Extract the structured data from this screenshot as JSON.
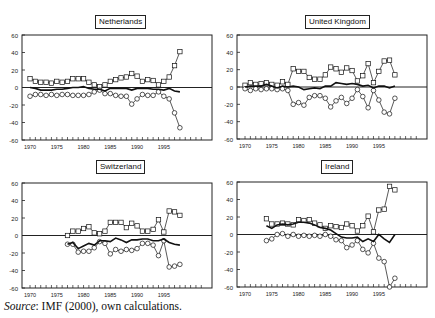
{
  "source": {
    "label": "Source",
    "text": ": IMF (2000), own calculations."
  },
  "chart_data": [
    {
      "type": "line",
      "title": "Netherlands",
      "xlabel": "",
      "ylabel": "",
      "xlim": [
        1968.5,
        2004
      ],
      "ylim": [
        -60,
        60
      ],
      "xticks": [
        "1970",
        "1975",
        "1980",
        "1985",
        "1990",
        "1995"
      ],
      "yticks": [
        "60",
        "40",
        "20",
        "0",
        "-20",
        "-40",
        "-60"
      ],
      "series": [
        {
          "name": "squares",
          "marker": "square",
          "x": [
            1970,
            1971,
            1972,
            1973,
            1974,
            1975,
            1976,
            1977,
            1978,
            1979,
            1980,
            1981,
            1982,
            1983,
            1984,
            1985,
            1986,
            1987,
            1988,
            1989,
            1990,
            1991,
            1992,
            1993,
            1994,
            1995,
            1996,
            1997,
            1998
          ],
          "values": [
            10,
            7,
            6,
            6,
            5,
            7,
            6,
            7,
            10,
            10,
            10,
            6,
            3,
            1,
            3,
            7,
            9,
            11,
            12,
            16,
            13,
            7,
            9,
            8,
            3,
            7,
            12,
            25,
            41
          ]
        },
        {
          "name": "circles",
          "marker": "circle",
          "x": [
            1970,
            1971,
            1972,
            1973,
            1974,
            1975,
            1976,
            1977,
            1978,
            1979,
            1980,
            1981,
            1982,
            1983,
            1984,
            1985,
            1986,
            1987,
            1988,
            1989,
            1990,
            1991,
            1992,
            1993,
            1994,
            1995,
            1996,
            1997,
            1998
          ],
          "values": [
            -10,
            -8,
            -8,
            -9,
            -8,
            -9,
            -8,
            -8,
            -9,
            -9,
            -9,
            -8,
            -5,
            -3,
            -7,
            -7,
            -9,
            -10,
            -10,
            -19,
            -13,
            -8,
            -9,
            -9,
            -5,
            -10,
            -13,
            -29,
            -46
          ]
        },
        {
          "name": "line",
          "marker": "none",
          "x": [
            1970,
            1971,
            1972,
            1973,
            1974,
            1975,
            1976,
            1977,
            1978,
            1979,
            1980,
            1981,
            1982,
            1983,
            1984,
            1985,
            1986,
            1987,
            1988,
            1989,
            1990,
            1991,
            1992,
            1993,
            1994,
            1995,
            1996,
            1997,
            1998
          ],
          "values": [
            0,
            -1,
            -3,
            -3,
            -3,
            -2,
            -2,
            -1,
            0,
            0,
            1,
            -1,
            -2,
            -2,
            -4,
            -1,
            -1,
            -1,
            -1,
            -3,
            -1,
            -1,
            -1,
            -2,
            -2,
            -3,
            -1,
            -4,
            -5
          ]
        }
      ]
    },
    {
      "type": "line",
      "title": "United Kingdom",
      "xlabel": "",
      "ylabel": "",
      "xlim": [
        1968.5,
        2004
      ],
      "ylim": [
        -60,
        60
      ],
      "xticks": [
        "1970",
        "1975",
        "1980",
        "1985",
        "1990",
        "1995"
      ],
      "yticks": [
        "60",
        "40",
        "20",
        "0",
        "-20",
        "-40",
        "-60"
      ],
      "series": [
        {
          "name": "squares",
          "marker": "square",
          "x": [
            1970,
            1971,
            1972,
            1973,
            1974,
            1975,
            1976,
            1977,
            1978,
            1979,
            1980,
            1981,
            1982,
            1983,
            1984,
            1985,
            1986,
            1987,
            1988,
            1989,
            1990,
            1991,
            1992,
            1993,
            1994,
            1995,
            1996,
            1997,
            1998
          ],
          "values": [
            2,
            5,
            3,
            4,
            5,
            3,
            2,
            6,
            3,
            21,
            18,
            18,
            11,
            9,
            9,
            14,
            23,
            21,
            17,
            22,
            19,
            7,
            13,
            27,
            5,
            18,
            30,
            31,
            14
          ]
        },
        {
          "name": "circles",
          "marker": "circle",
          "x": [
            1970,
            1971,
            1972,
            1973,
            1974,
            1975,
            1976,
            1977,
            1978,
            1979,
            1980,
            1981,
            1982,
            1983,
            1984,
            1985,
            1986,
            1987,
            1988,
            1989,
            1990,
            1991,
            1992,
            1993,
            1994,
            1995,
            1996,
            1997,
            1998
          ],
          "values": [
            -2,
            -4,
            -2,
            -3,
            -2,
            -2,
            -3,
            -2,
            -4,
            -20,
            -18,
            -21,
            -12,
            -10,
            -10,
            -13,
            -23,
            -16,
            -12,
            -19,
            -13,
            -3,
            -11,
            -24,
            -4,
            -15,
            -29,
            -31,
            -13
          ]
        },
        {
          "name": "line",
          "marker": "none",
          "x": [
            1970,
            1971,
            1972,
            1973,
            1974,
            1975,
            1976,
            1977,
            1978,
            1979,
            1980,
            1981,
            1982,
            1983,
            1984,
            1985,
            1986,
            1987,
            1988,
            1989,
            1990,
            1991,
            1992,
            1993,
            1994,
            1995,
            1996,
            1997,
            1998
          ],
          "values": [
            0,
            1,
            1,
            1,
            3,
            1,
            -1,
            1,
            0,
            1,
            0,
            -3,
            -2,
            -1,
            -2,
            1,
            1,
            5,
            4,
            3,
            4,
            3,
            1,
            2,
            -1,
            1,
            1,
            -1,
            1
          ]
        }
      ]
    },
    {
      "type": "line",
      "title": "Switzerland",
      "xlabel": "",
      "ylabel": "",
      "xlim": [
        1968.5,
        2004
      ],
      "ylim": [
        -60,
        60
      ],
      "xticks": [
        "1970",
        "1975",
        "1980",
        "1985",
        "1990",
        "1995"
      ],
      "yticks": [
        "60",
        "40",
        "20",
        "0",
        "-20",
        "-40",
        "-60"
      ],
      "series": [
        {
          "name": "squares",
          "marker": "square",
          "x": [
            1977,
            1978,
            1979,
            1980,
            1981,
            1982,
            1983,
            1984,
            1985,
            1986,
            1987,
            1988,
            1989,
            1990,
            1991,
            1992,
            1993,
            1994,
            1995,
            1996,
            1997,
            1998
          ],
          "values": [
            0,
            5,
            5,
            8,
            10,
            3,
            2,
            5,
            15,
            15,
            15,
            9,
            14,
            11,
            5,
            5,
            7,
            18,
            4,
            28,
            27,
            23
          ]
        },
        {
          "name": "circles",
          "marker": "circle",
          "x": [
            1977,
            1978,
            1979,
            1980,
            1981,
            1982,
            1983,
            1984,
            1985,
            1986,
            1987,
            1988,
            1989,
            1990,
            1991,
            1992,
            1993,
            1994,
            1995,
            1996,
            1997,
            1998
          ],
          "values": [
            -10,
            -10,
            -19,
            -18,
            -18,
            -14,
            -7,
            -9,
            -21,
            -16,
            -18,
            -16,
            -17,
            -15,
            -9,
            -9,
            -11,
            -23,
            -6,
            -36,
            -35,
            -33
          ]
        },
        {
          "name": "line",
          "marker": "none",
          "x": [
            1977,
            1978,
            1979,
            1980,
            1981,
            1982,
            1983,
            1984,
            1985,
            1986,
            1987,
            1988,
            1989,
            1990,
            1991,
            1992,
            1993,
            1994,
            1995,
            1996,
            1997,
            1998
          ],
          "values": [
            -10,
            -8,
            -15,
            -12,
            -9,
            -11,
            -6,
            -6,
            -7,
            -3,
            -5,
            -8,
            -5,
            -5,
            -4,
            -4,
            -6,
            -6,
            -4,
            -8,
            -10,
            -11
          ]
        }
      ]
    },
    {
      "type": "line",
      "title": "Ireland",
      "xlabel": "",
      "ylabel": "",
      "xlim": [
        1968.5,
        2004
      ],
      "ylim": [
        -60,
        60
      ],
      "xticks": [
        "1970",
        "1975",
        "1980",
        "1985",
        "1990",
        "1995"
      ],
      "yticks": [
        "60",
        "40",
        "20",
        "0",
        "-20",
        "-40",
        "-60"
      ],
      "series": [
        {
          "name": "squares",
          "marker": "square",
          "x": [
            1974,
            1975,
            1976,
            1977,
            1978,
            1979,
            1980,
            1981,
            1982,
            1983,
            1984,
            1985,
            1986,
            1987,
            1988,
            1989,
            1990,
            1991,
            1992,
            1993,
            1994,
            1995,
            1996,
            1997,
            1998
          ],
          "values": [
            18,
            12,
            12,
            13,
            12,
            11,
            17,
            16,
            17,
            13,
            11,
            7,
            10,
            9,
            8,
            12,
            10,
            4,
            10,
            21,
            3,
            28,
            29,
            55,
            51
          ]
        },
        {
          "name": "circles",
          "marker": "circle",
          "x": [
            1974,
            1975,
            1976,
            1977,
            1978,
            1979,
            1980,
            1981,
            1982,
            1983,
            1984,
            1985,
            1986,
            1987,
            1988,
            1989,
            1990,
            1991,
            1992,
            1993,
            1994,
            1995,
            1996,
            1997,
            1998
          ],
          "values": [
            -7,
            -5,
            0,
            1,
            -2,
            0,
            -2,
            -1,
            -2,
            -1,
            -2,
            0,
            -2,
            -6,
            -7,
            -15,
            -12,
            -7,
            -17,
            -21,
            -10,
            -27,
            -31,
            -64,
            -50
          ]
        },
        {
          "name": "line",
          "marker": "none",
          "x": [
            1974,
            1975,
            1976,
            1977,
            1978,
            1979,
            1980,
            1981,
            1982,
            1983,
            1984,
            1985,
            1986,
            1987,
            1988,
            1989,
            1990,
            1991,
            1992,
            1993,
            1994,
            1995,
            1996,
            1997,
            1998
          ],
          "values": [
            10,
            7,
            11,
            12,
            11,
            12,
            14,
            14,
            13,
            11,
            8,
            7,
            5,
            1,
            -3,
            -4,
            -4,
            -3,
            -8,
            -5,
            -8,
            0,
            -5,
            -9,
            0
          ]
        }
      ]
    }
  ]
}
